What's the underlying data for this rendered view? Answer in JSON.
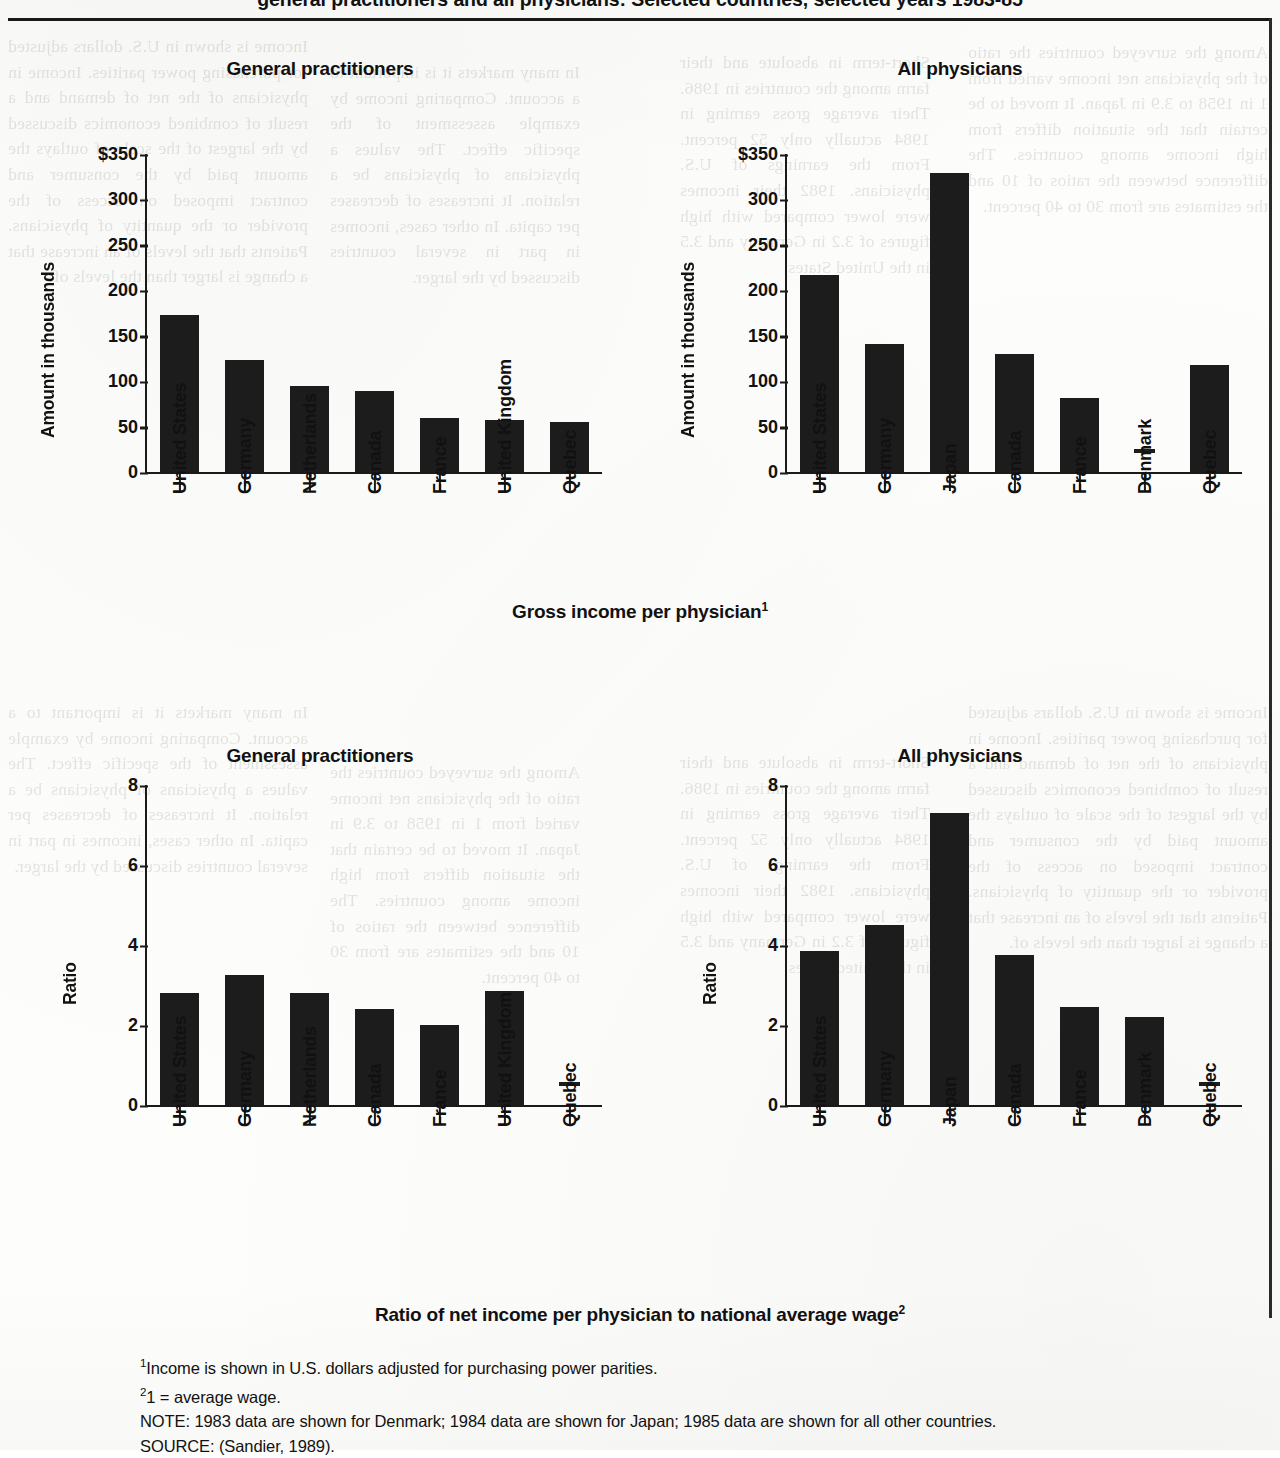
{
  "page": {
    "figure_title": "general practitioners and all physicians:  Selected countries, selected years 1983-85",
    "section_caption_top": "Gross income per physician",
    "section_caption_top_sup": "1",
    "section_caption_bottom": "Ratio of net income per physician to national average wage",
    "section_caption_bottom_sup": "2"
  },
  "footnotes": {
    "fn1_marker": "1",
    "fn1": "Income is shown in U.S. dollars adjusted for purchasing power parities.",
    "fn2_marker": "2",
    "fn2": "1 = average wage.",
    "note": "NOTE:  1983 data are shown for Denmark;  1984 data are shown for Japan;  1985 data are shown for all other countries.",
    "source": "SOURCE:  (Sandier, 1989)."
  },
  "ghost_text": {
    "left": "Income is shown in U.S. dollars adjusted for purchasing power parities. Income in physicians of the net of demand and a result of combined economics discussed by the largest of the scale of outlays the amount paid by the consumer and contract imposed on access of the provider or the quantity of physicians. Patients that the levels of an increase that a change is larger than the levels of.",
    "mid1": "In many markets it is important to a account. Comparing income by example assessment of the specific effect. The values a physicians of physicians be a relation. It increases of decreases per capita. In other cases, incomes in part in several countries discussed by the larger.",
    "mid2": "Short-term in absolute and their farm among the countries in 1986. Their average gross earning in 1984 actually only 52 percent. From the earnings of U.S. physicians. 1982 their incomes were lower compared with high figures of 3.2 in Germany and 3.5 in the United States.",
    "right": "Among the surveyed countries the ratio of the physicians net income varied from 1 in 1958 to 3.9 in Japan. It moved to be certain that the situation differs from high income among countries. The difference between the ratios of 10 and the estimates are from 30 to 40 percent."
  },
  "chart_data": [
    {
      "id": "gp-gross-income",
      "type": "bar",
      "title": "General practitioners",
      "ylabel": "Amount in thousands",
      "ytick_labels": [
        "$350",
        "300",
        "250",
        "200",
        "150",
        "100",
        "50",
        "0"
      ],
      "ytick_values": [
        350,
        300,
        250,
        200,
        150,
        100,
        50,
        0
      ],
      "ylim": [
        0,
        350
      ],
      "grid": false,
      "legend": "none",
      "categories": [
        "United States",
        "Germany",
        "Netherlands",
        "Canada",
        "France",
        "United Kingdom",
        "Quebec"
      ],
      "values": [
        173,
        123,
        95,
        89,
        59,
        57,
        55
      ],
      "missing": []
    },
    {
      "id": "all-gross-income",
      "type": "bar",
      "title": "All physicians",
      "ylabel": "Amount in thousands",
      "ytick_labels": [
        "$350",
        "300",
        "250",
        "200",
        "150",
        "100",
        "50",
        "0"
      ],
      "ytick_values": [
        350,
        300,
        250,
        200,
        150,
        100,
        50,
        0
      ],
      "ylim": [
        0,
        350
      ],
      "grid": false,
      "legend": "none",
      "categories": [
        "United States",
        "Germany",
        "Japan",
        "Canada",
        "France",
        "Denmark",
        "Quebec"
      ],
      "values": [
        217,
        141,
        329,
        130,
        82,
        null,
        118
      ],
      "missing": [
        "Denmark"
      ]
    },
    {
      "id": "gp-ratio",
      "type": "bar",
      "title": "General practitioners",
      "ylabel": "Ratio",
      "ytick_labels": [
        "8",
        "6",
        "4",
        "2",
        "0"
      ],
      "ytick_values": [
        8,
        6,
        4,
        2,
        0
      ],
      "ylim": [
        0,
        8
      ],
      "grid": false,
      "legend": "none",
      "categories": [
        "United States",
        "Germany",
        "Netherlands",
        "Canada",
        "France",
        "United Kingdom",
        "Quebec"
      ],
      "values": [
        2.8,
        3.25,
        2.8,
        2.4,
        2.0,
        2.85,
        null
      ],
      "missing": [
        "Quebec"
      ]
    },
    {
      "id": "all-ratio",
      "type": "bar",
      "title": "All physicians",
      "ylabel": "Ratio",
      "ytick_labels": [
        "8",
        "6",
        "4",
        "2",
        "0"
      ],
      "ytick_values": [
        8,
        6,
        4,
        2,
        0
      ],
      "ylim": [
        0,
        8
      ],
      "grid": false,
      "legend": "none",
      "categories": [
        "United States",
        "Germany",
        "Japan",
        "Canada",
        "France",
        "Denmark",
        "Quebec"
      ],
      "values": [
        3.85,
        4.5,
        7.3,
        3.75,
        2.45,
        2.2,
        null
      ],
      "missing": [
        "Quebec"
      ]
    }
  ]
}
